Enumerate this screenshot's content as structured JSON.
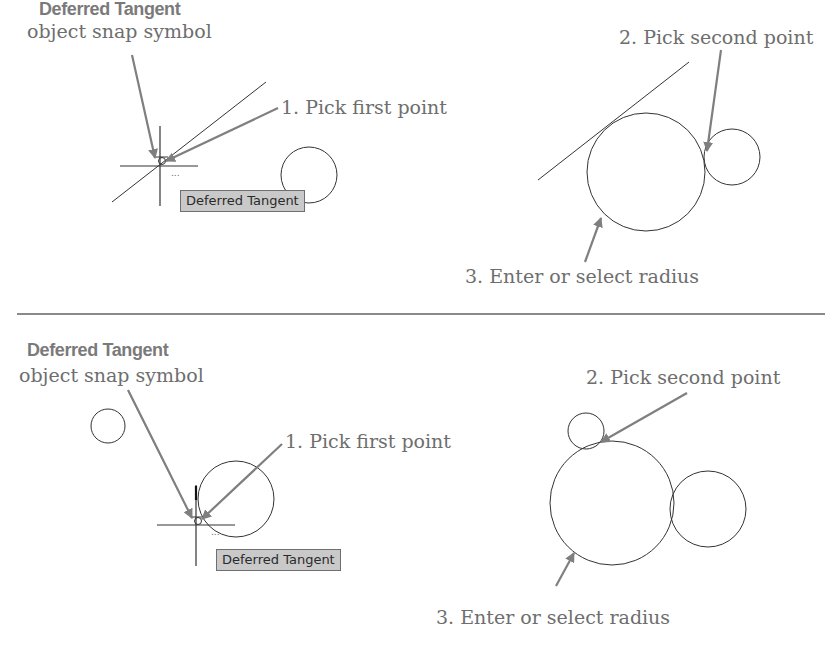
{
  "figure": {
    "colors": {
      "label_text": "#6e6e6e",
      "arrow": "#7f7f7f",
      "geometry": "#333333",
      "tooltip_bg": "#c9c9c9",
      "tooltip_border": "#6f6f6f",
      "divider": "#8a8a8a"
    },
    "top_panel": {
      "symbol_title": "Deferred Tangent",
      "symbol_subtitle": "object snap symbol",
      "step1": "1. Pick first point",
      "step2": "2. Pick second point",
      "step3": "3. Enter or select radius",
      "tooltip": "Deferred Tangent",
      "icons": [
        "crosshair-cursor-icon",
        "deferred-tangent-snap-icon",
        "arrow-icon"
      ]
    },
    "bottom_panel": {
      "symbol_title": "Deferred Tangent",
      "symbol_subtitle": "object snap symbol",
      "step1": "1. Pick first point",
      "step2": "2. Pick second point",
      "step3": "3. Enter or select radius",
      "tooltip": "Deferred Tangent",
      "icons": [
        "crosshair-cursor-icon",
        "deferred-tangent-snap-icon",
        "arrow-icon"
      ]
    }
  }
}
